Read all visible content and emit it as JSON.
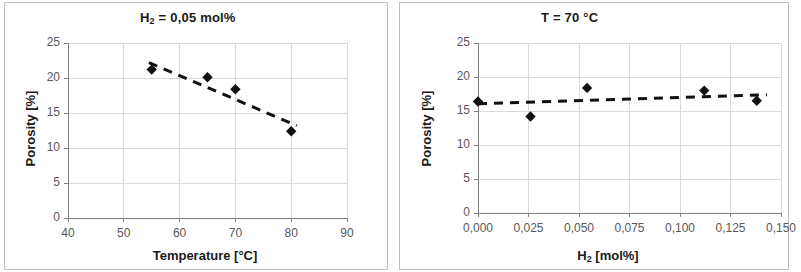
{
  "figure": {
    "background": "#ffffff",
    "axis_color": "#808080",
    "grid_color": "#d9d9d9",
    "marker_color": "#111111",
    "trend_color": "#111111"
  },
  "chart_data": [
    {
      "id": "left",
      "type": "scatter",
      "title": "H₂ = 0,05 mol%",
      "title_parts": {
        "pre": "H",
        "sub": "2",
        "post": " = 0,05 mol%"
      },
      "xlabel": "Temperature [°C]",
      "ylabel": "Porosity [%]",
      "xlim": [
        40,
        90
      ],
      "ylim": [
        0,
        25
      ],
      "xticks": [
        40,
        50,
        60,
        70,
        80,
        90
      ],
      "xticklabels": [
        "40",
        "50",
        "60",
        "70",
        "80",
        "90"
      ],
      "yticks": [
        0,
        5,
        10,
        15,
        20,
        25
      ],
      "yticklabels": [
        "0",
        "5",
        "10",
        "15",
        "20",
        "25"
      ],
      "grid": true,
      "legend": false,
      "marker": "diamond",
      "x": [
        55,
        65,
        70,
        80
      ],
      "y": [
        21.2,
        20.1,
        18.4,
        12.4
      ],
      "points": [
        {
          "x": 55,
          "y": 21.2
        },
        {
          "x": 65,
          "y": 20.1
        },
        {
          "x": 70,
          "y": 18.4
        },
        {
          "x": 80,
          "y": 12.4
        }
      ],
      "trendline": {
        "style": "dashed",
        "x": [
          54.5,
          81.0
        ],
        "y": [
          22.2,
          13.2
        ]
      }
    },
    {
      "id": "right",
      "type": "scatter",
      "title": "T = 70 °C",
      "xlabel": "H₂ [mol%]",
      "xlabel_parts": {
        "pre": "H",
        "sub": "2",
        "post": " [mol%]"
      },
      "ylabel": "Porosity [%]",
      "xlim": [
        0.0,
        0.15
      ],
      "ylim": [
        0,
        25
      ],
      "xticks": [
        0.0,
        0.025,
        0.05,
        0.075,
        0.1,
        0.125,
        0.15
      ],
      "xticklabels": [
        "0,000",
        "0,025",
        "0,050",
        "0,075",
        "0,100",
        "0,125",
        "0,150"
      ],
      "yticks": [
        0,
        5,
        10,
        15,
        20,
        25
      ],
      "yticklabels": [
        "0",
        "5",
        "10",
        "15",
        "20",
        "25"
      ],
      "grid": true,
      "legend": false,
      "marker": "diamond",
      "x": [
        0.0,
        0.026,
        0.054,
        0.112,
        0.138
      ],
      "y": [
        16.4,
        14.2,
        18.4,
        18.0,
        16.5
      ],
      "points": [
        {
          "x": 0.0,
          "y": 16.4
        },
        {
          "x": 0.026,
          "y": 14.2
        },
        {
          "x": 0.054,
          "y": 18.4
        },
        {
          "x": 0.112,
          "y": 18.0
        },
        {
          "x": 0.138,
          "y": 16.5
        }
      ],
      "trendline": {
        "style": "dashed",
        "x": [
          0.0,
          0.143
        ],
        "y": [
          16.05,
          17.4
        ]
      }
    }
  ]
}
